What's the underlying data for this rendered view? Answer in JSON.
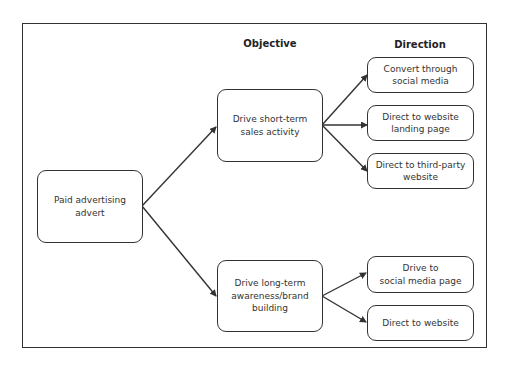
{
  "headers": {
    "objective": "Objective",
    "direction": "Direction"
  },
  "nodes": {
    "root": "Paid advertising\nadvert",
    "objectives": [
      "Drive short-term\nsales activity",
      "Drive long-term\nawareness/brand\nbuilding"
    ],
    "directions_short_term": [
      "Convert through\nsocial media",
      "Direct to website\nlanding page",
      "Direct to third-party\nwebsite"
    ],
    "directions_long_term": [
      "Drive to\nsocial media page",
      "Direct to website"
    ]
  },
  "colors": {
    "stroke": "#333333",
    "text": "#333333",
    "background": "#ffffff"
  }
}
